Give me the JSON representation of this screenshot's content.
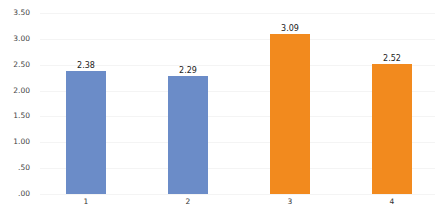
{
  "chart_data": {
    "type": "bar",
    "title": "",
    "xlabel": "",
    "ylabel": "",
    "categories": [
      "1",
      "2",
      "3",
      "4"
    ],
    "values": [
      2.38,
      2.29,
      3.09,
      2.52
    ],
    "value_labels": [
      "2.38",
      "2.29",
      "3.09",
      "2.52"
    ],
    "bar_colors": [
      "#6B8CC8",
      "#6B8CC8",
      "#F28A1E",
      "#F28A1E"
    ],
    "ylim": [
      0,
      3.5
    ],
    "yticks": [
      0,
      0.5,
      1.0,
      1.5,
      2.0,
      2.5,
      3.0,
      3.5
    ],
    "ytick_labels": [
      ".00",
      ".50",
      "1.00",
      "1.50",
      "2.00",
      "2.50",
      "3.00",
      "3.50"
    ],
    "grid": false,
    "legend": null
  }
}
